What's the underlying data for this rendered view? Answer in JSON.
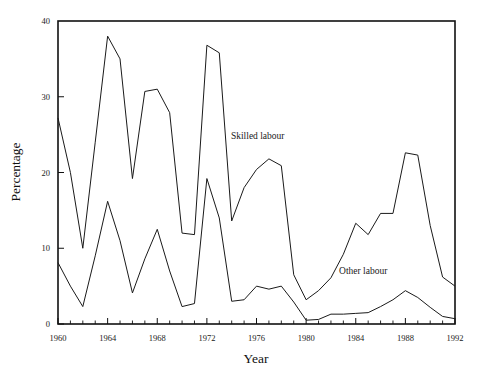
{
  "chart_data": {
    "type": "line",
    "title": "",
    "xlabel": "Year",
    "ylabel": "Percentage",
    "xlim": [
      1960,
      1992
    ],
    "ylim": [
      0,
      40
    ],
    "grid": false,
    "legend_position": "inline-annotation",
    "x_tick_labels": [
      "1960",
      "1964",
      "1968",
      "1972",
      "1976",
      "1980",
      "1984",
      "1988",
      "1992"
    ],
    "x_tick_values": [
      1960,
      1964,
      1968,
      1972,
      1976,
      1980,
      1984,
      1988,
      1992
    ],
    "x_minor_tick_step": 1,
    "y_tick_labels": [
      "0",
      "10",
      "20",
      "30",
      "40"
    ],
    "y_tick_values": [
      0,
      10,
      20,
      30,
      40
    ],
    "x": [
      1960,
      1961,
      1962,
      1963,
      1964,
      1965,
      1966,
      1967,
      1968,
      1969,
      1970,
      1971,
      1972,
      1973,
      1974,
      1975,
      1976,
      1977,
      1978,
      1979,
      1980,
      1981,
      1982,
      1983,
      1984,
      1985,
      1986,
      1987,
      1988,
      1989,
      1990,
      1991,
      1992
    ],
    "series": [
      {
        "name": "Skilled labour",
        "annotation_label": "Skilled labour",
        "annotation_x": 1976.1,
        "annotation_y": 24.4,
        "color": "#1a1a1a",
        "values": [
          27.2,
          20.0,
          10.0,
          24.0,
          38.0,
          35.0,
          19.2,
          30.7,
          31.0,
          27.9,
          12.0,
          11.8,
          36.8,
          35.8,
          13.6,
          18.0,
          20.4,
          21.8,
          20.9,
          6.5,
          3.2,
          4.4,
          6.1,
          9.2,
          13.3,
          11.8,
          14.6,
          14.6,
          22.6,
          22.3,
          13.0,
          6.2,
          5.0
        ]
      },
      {
        "name": "Other labour",
        "annotation_label": "Other labour",
        "annotation_x": 1984.6,
        "annotation_y": 6.6,
        "color": "#1a1a1a",
        "values": [
          8.1,
          5.0,
          2.3,
          9.0,
          16.2,
          11.0,
          4.1,
          8.6,
          12.5,
          7.0,
          2.3,
          2.7,
          19.2,
          14.0,
          3.0,
          3.2,
          5.0,
          4.6,
          5.0,
          2.9,
          0.5,
          0.6,
          1.3,
          1.3,
          1.4,
          1.5,
          2.3,
          3.2,
          4.4,
          3.5,
          2.2,
          1.0,
          0.7
        ]
      }
    ]
  }
}
